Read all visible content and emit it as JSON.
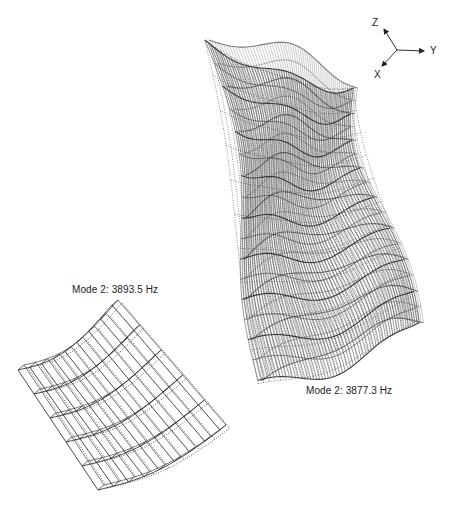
{
  "figure": {
    "large_model": {
      "label": "Mode 2: 3877.3 Hz",
      "description": "full cylindrical shell wireframe, deformed vs undeformed"
    },
    "small_model": {
      "label": "Mode 2: 3893.5 Hz",
      "description": "curved panel segment wireframe, deformed vs undeformed"
    },
    "axis_triad": {
      "z": "Z",
      "y": "Y",
      "x": "X"
    },
    "colors": {
      "mesh_solid": "#2a2a2a",
      "mesh_dotted": "#3a3a3a",
      "background": "#ffffff",
      "text": "#222222"
    }
  }
}
